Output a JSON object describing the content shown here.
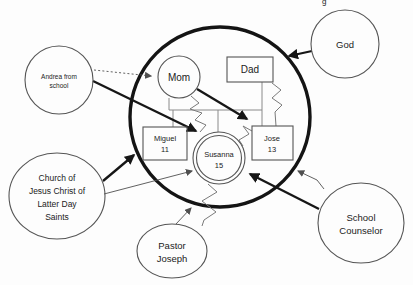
{
  "colors": {
    "background": "#fdfdfd",
    "system_circle": "#141414",
    "thick_arrow": "#161616",
    "thin_stroke": "#555555",
    "family_line": "#8a8a8a",
    "text": "#222222"
  },
  "artifact": {
    "clipped_char": "g"
  },
  "nodes": {
    "god": {
      "label": "God",
      "shape": "circle"
    },
    "andrea": {
      "lines": [
        "Andrea from",
        "school"
      ],
      "shape": "circle"
    },
    "church": {
      "lines": [
        "Church of",
        "Jesus Christ of",
        "Latter Day",
        "Saints"
      ],
      "shape": "ellipse"
    },
    "pastor": {
      "lines": [
        "Pastor",
        "Joseph"
      ],
      "shape": "ellipse"
    },
    "school_counselor": {
      "lines": [
        "School",
        "Counselor"
      ],
      "shape": "ellipse"
    },
    "mom": {
      "label": "Mom",
      "shape": "circle"
    },
    "dad": {
      "label": "Dad",
      "shape": "rect"
    },
    "miguel": {
      "lines": [
        "Miguel",
        "11"
      ],
      "shape": "rect"
    },
    "susanna": {
      "lines": [
        "Susanna",
        "15"
      ],
      "shape": "double-circle"
    },
    "jose": {
      "lines": [
        "Jose",
        "13"
      ],
      "shape": "rect"
    }
  },
  "relationships": [
    {
      "from": "andrea",
      "to": "mom",
      "style": "dotted-arrow"
    },
    {
      "from": "andrea",
      "to": "susanna",
      "style": "thick-arrow"
    },
    {
      "from": "mom",
      "to": "jose",
      "style": "thick-arrow"
    },
    {
      "from": "god",
      "to": "family-circle",
      "style": "thick-arrow"
    },
    {
      "from": "church",
      "to": "family-circle",
      "style": "thick-arrow"
    },
    {
      "from": "church",
      "to": "susanna",
      "style": "thin-arrow"
    },
    {
      "from": "pastor",
      "to": "family-circle",
      "style": "thin-arrow"
    },
    {
      "from": "school_counselor",
      "to": "family-circle",
      "style": "thin-arrow"
    },
    {
      "from": "school_counselor",
      "to": "susanna",
      "style": "thick-arrow"
    },
    {
      "from": "mom",
      "to": "susanna",
      "style": "zigzag"
    },
    {
      "from": "dad",
      "to": "jose",
      "style": "zigzag"
    },
    {
      "from": "susanna",
      "to": "jose",
      "style": "zigzag"
    },
    {
      "from": "susanna",
      "to": "pastor",
      "style": "zigzag"
    }
  ]
}
